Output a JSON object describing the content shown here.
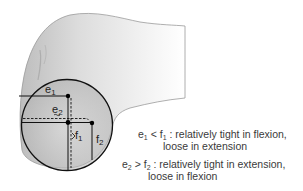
{
  "figure": {
    "labels": {
      "e1": "e",
      "e1_sub": "1",
      "e2": "e",
      "e2_sub": "2",
      "f1": "f",
      "f1_sub": "1",
      "f2": "f",
      "f2_sub": "2"
    },
    "captions": [
      {
        "lhs_var": "e",
        "lhs_sub": "1",
        "op": " < ",
        "rhs_var": "f",
        "rhs_sub": "1",
        "line1": " : relatively tight in flexion,",
        "line2": "loose in extension"
      },
      {
        "lhs_var": "e",
        "lhs_sub": "2",
        "op": " > ",
        "rhs_var": "f",
        "rhs_sub": "2",
        "line1": " : relatively tight in extension,",
        "line2": "loose in flexion"
      }
    ],
    "colors": {
      "bone_fill": "#d9d9d9",
      "bone_edge": "#8a8a8a",
      "line": "#111111",
      "text": "#3a3a3a"
    }
  }
}
